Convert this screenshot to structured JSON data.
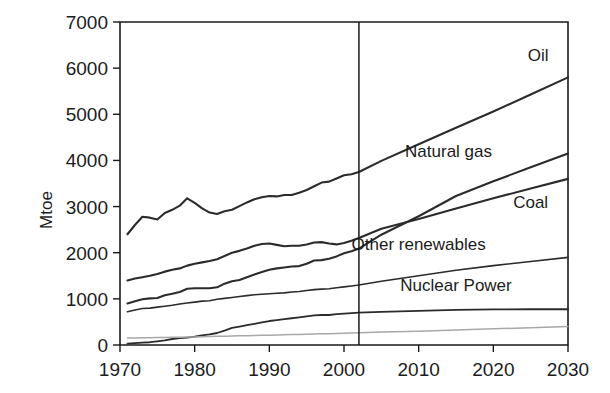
{
  "chart_data": {
    "type": "line",
    "title": "",
    "subtitle": "",
    "xlabel": "",
    "ylabel": "Mtoe",
    "xlim": [
      1970,
      2030
    ],
    "ylim": [
      0,
      7000
    ],
    "grid": false,
    "legend_position": "inline-right",
    "x_ticks": [
      "1970",
      "1980",
      "1990",
      "2000",
      "2010",
      "2020",
      "2030"
    ],
    "y_ticks": [
      "0",
      "1000",
      "2000",
      "3000",
      "4000",
      "5000",
      "6000",
      "7000"
    ],
    "annotations": [
      {
        "name": "history-projection-divider",
        "type": "vline",
        "x": 2002,
        "label": ""
      }
    ],
    "x": [
      1971,
      1972,
      1973,
      1974,
      1975,
      1976,
      1977,
      1978,
      1979,
      1980,
      1981,
      1982,
      1983,
      1984,
      1985,
      1986,
      1987,
      1988,
      1989,
      1990,
      1991,
      1992,
      1993,
      1994,
      1995,
      1996,
      1997,
      1998,
      1999,
      2000,
      2001,
      2002,
      2005,
      2010,
      2015,
      2020,
      2025,
      2030
    ],
    "series": [
      {
        "name": "Oil",
        "label": "Oil",
        "color": "#2b2b2b",
        "width": 2.1,
        "label_x": 2026,
        "label_y": 6150,
        "values": [
          2400,
          2600,
          2780,
          2760,
          2720,
          2860,
          2930,
          3020,
          3180,
          3080,
          2960,
          2870,
          2840,
          2900,
          2930,
          3010,
          3090,
          3160,
          3200,
          3230,
          3220,
          3250,
          3250,
          3300,
          3360,
          3440,
          3520,
          3540,
          3610,
          3680,
          3700,
          3750,
          3990,
          4350,
          4710,
          5060,
          5430,
          5800
        ]
      },
      {
        "name": "Coal",
        "label": "Coal",
        "color": "#2b2b2b",
        "width": 2.1,
        "label_x": 2025,
        "label_y": 2960,
        "values": [
          1400,
          1440,
          1470,
          1500,
          1540,
          1590,
          1630,
          1660,
          1720,
          1760,
          1790,
          1820,
          1860,
          1930,
          2000,
          2040,
          2090,
          2150,
          2190,
          2200,
          2170,
          2140,
          2150,
          2150,
          2180,
          2220,
          2230,
          2200,
          2180,
          2210,
          2260,
          2320,
          2520,
          2730,
          2960,
          3180,
          3390,
          3600
        ]
      },
      {
        "name": "Natural gas",
        "label": "Natural gas",
        "color": "#2b2b2b",
        "width": 2.1,
        "label_x": 2014,
        "label_y": 4080,
        "values": [
          900,
          950,
          990,
          1010,
          1020,
          1080,
          1110,
          1150,
          1220,
          1230,
          1230,
          1230,
          1250,
          1330,
          1380,
          1410,
          1470,
          1530,
          1580,
          1630,
          1660,
          1680,
          1700,
          1710,
          1760,
          1830,
          1840,
          1870,
          1920,
          1990,
          2030,
          2090,
          2390,
          2790,
          3230,
          3550,
          3850,
          4150
        ]
      },
      {
        "name": "Other renewables",
        "label": "Other renewables",
        "color": "#2b2b2b",
        "width": 1.6,
        "label_x": 2010,
        "label_y": 2060,
        "values": [
          720,
          760,
          790,
          800,
          820,
          840,
          860,
          890,
          910,
          930,
          950,
          960,
          990,
          1010,
          1030,
          1050,
          1070,
          1090,
          1100,
          1110,
          1120,
          1130,
          1150,
          1160,
          1180,
          1200,
          1210,
          1220,
          1240,
          1260,
          1280,
          1300,
          1380,
          1500,
          1620,
          1720,
          1810,
          1900
        ]
      },
      {
        "name": "Nuclear Power",
        "label": "Nuclear Power",
        "color": "#2b2b2b",
        "width": 1.8,
        "label_x": 2015,
        "label_y": 1160,
        "values": [
          30,
          40,
          50,
          60,
          80,
          100,
          130,
          150,
          160,
          180,
          210,
          230,
          260,
          310,
          370,
          400,
          430,
          460,
          490,
          520,
          540,
          560,
          580,
          600,
          620,
          640,
          650,
          650,
          670,
          680,
          690,
          700,
          720,
          740,
          760,
          770,
          775,
          775
        ]
      },
      {
        "name": "Biomass and waste",
        "label": "",
        "color": "#a8a8a8",
        "width": 1.5,
        "label_x": null,
        "label_y": null,
        "values": [
          150,
          152,
          155,
          158,
          160,
          163,
          166,
          170,
          173,
          176,
          180,
          183,
          187,
          190,
          194,
          198,
          202,
          206,
          210,
          214,
          218,
          222,
          226,
          230,
          234,
          238,
          242,
          246,
          250,
          255,
          260,
          265,
          280,
          300,
          325,
          350,
          375,
          400
        ]
      }
    ]
  },
  "axes": {
    "y_axis_title": "Mtoe"
  }
}
